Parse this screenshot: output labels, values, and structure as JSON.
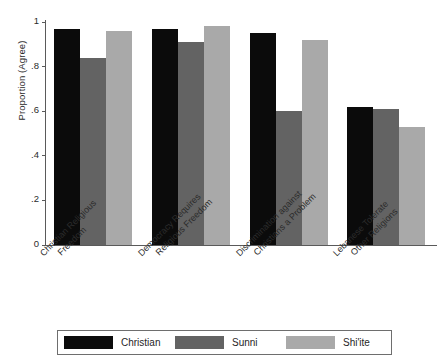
{
  "chart_data": {
    "type": "bar",
    "title": "",
    "xlabel": "",
    "ylabel": "Proportion (Agree)",
    "ylim": [
      0,
      1
    ],
    "yticks": [
      "0",
      ".2",
      ".4",
      ".6",
      ".8",
      "1"
    ],
    "ytick_values": [
      0,
      0.2,
      0.4,
      0.6,
      0.8,
      1
    ],
    "grid": false,
    "legend_position": "bottom",
    "categories": [
      "Christian Religious Freedom",
      "Democracy Requires Religious Freedom",
      "Discrimination against Christians a Problem",
      "Lebanese Tolerate Other Religions"
    ],
    "category_lines": [
      [
        "Christian Religious",
        "Freedom"
      ],
      [
        "Democracy Requires",
        "Religious Freedom"
      ],
      [
        "Discrimination against",
        "Christians a Problem"
      ],
      [
        "Lebanese Tolerate",
        "Other Religions"
      ]
    ],
    "series": [
      {
        "name": "Christian",
        "color": "#0b0b0b",
        "values": [
          0.97,
          0.97,
          0.95,
          0.62
        ]
      },
      {
        "name": "Sunni",
        "color": "#636363",
        "values": [
          0.84,
          0.91,
          0.6,
          0.61
        ]
      },
      {
        "name": "Shi'ite",
        "color": "#a9a9a9",
        "values": [
          0.96,
          0.98,
          0.92,
          0.53
        ]
      }
    ]
  },
  "legend": {
    "items": [
      {
        "label": "Christian",
        "color": "#0b0b0b"
      },
      {
        "label": "Sunni",
        "color": "#636363"
      },
      {
        "label": "Shi'ite",
        "color": "#a9a9a9"
      }
    ]
  }
}
